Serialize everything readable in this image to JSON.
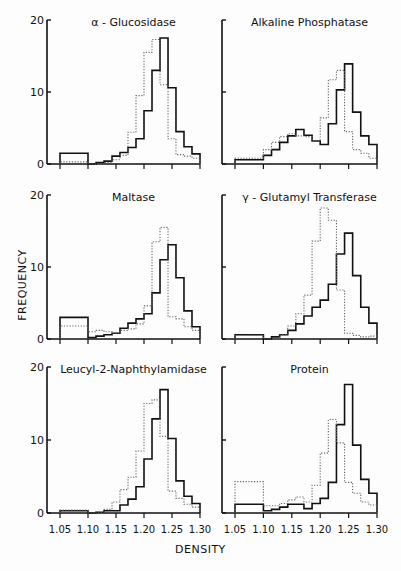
{
  "figure": {
    "ylabel": "FREQUENCY",
    "xlabel": "DENSITY",
    "x_ticks": [
      "1.05",
      "1.10",
      "1.15",
      "1.20",
      "1.25",
      "1.30"
    ],
    "y_ticks": [
      "0",
      "10",
      "20"
    ]
  },
  "chart_data": [
    {
      "type": "bar",
      "title": "α - Glucosidase",
      "xlabel": "DENSITY",
      "ylabel": "FREQUENCY",
      "xlim": [
        1.05,
        1.3
      ],
      "ylim": [
        0,
        20
      ],
      "bin_edges": [
        1.05,
        1.1,
        1.1143,
        1.1286,
        1.1429,
        1.1571,
        1.1714,
        1.1857,
        1.2,
        1.2143,
        1.2286,
        1.2429,
        1.2571,
        1.2714,
        1.2857,
        1.3
      ],
      "series": [
        {
          "name": "solid",
          "style": "solid",
          "values": [
            1.5,
            0,
            0.2,
            0.4,
            1.1,
            1.6,
            2.3,
            3.5,
            7.4,
            13,
            17.5,
            10.6,
            4.5,
            2.4,
            1.4
          ]
        },
        {
          "name": "dotted",
          "style": "dotted",
          "values": [
            0.3,
            0,
            0,
            0.2,
            0.6,
            1.2,
            4.4,
            9.5,
            15.5,
            17.3,
            11,
            3.5,
            1.3,
            1.1,
            0.8
          ]
        }
      ]
    },
    {
      "type": "bar",
      "title": "Alkaline Phosphatase",
      "xlabel": "DENSITY",
      "ylabel": "FREQUENCY",
      "xlim": [
        1.05,
        1.3
      ],
      "ylim": [
        0,
        20
      ],
      "bin_edges": [
        1.05,
        1.1,
        1.1143,
        1.1286,
        1.1429,
        1.1571,
        1.1714,
        1.1857,
        1.2,
        1.2143,
        1.2286,
        1.2429,
        1.2571,
        1.2714,
        1.2857,
        1.3
      ],
      "series": [
        {
          "name": "solid",
          "style": "solid",
          "values": [
            0.6,
            1.2,
            2.0,
            3.0,
            3.9,
            4.8,
            4.0,
            3.2,
            2.7,
            5.6,
            10.3,
            13.9,
            7.2,
            3.9,
            2.7
          ]
        },
        {
          "name": "dotted",
          "style": "dotted",
          "values": [
            0.8,
            2.0,
            3.0,
            3.8,
            4.2,
            3.9,
            3.8,
            3.2,
            6.4,
            11.7,
            13.0,
            4.5,
            2.0,
            1.5,
            0.8
          ]
        }
      ]
    },
    {
      "type": "bar",
      "title": "Maltase",
      "xlabel": "DENSITY",
      "ylabel": "FREQUENCY",
      "xlim": [
        1.05,
        1.3
      ],
      "ylim": [
        0,
        20
      ],
      "bin_edges": [
        1.05,
        1.1,
        1.1143,
        1.1286,
        1.1429,
        1.1571,
        1.1714,
        1.1857,
        1.2,
        1.2143,
        1.2286,
        1.2429,
        1.2571,
        1.2714,
        1.2857,
        1.3
      ],
      "series": [
        {
          "name": "solid",
          "style": "solid",
          "values": [
            3.0,
            0.2,
            0.4,
            0.6,
            0.8,
            1.5,
            2.2,
            2.8,
            3.5,
            6.4,
            11,
            13.1,
            8.5,
            3.9,
            1.7
          ]
        },
        {
          "name": "dotted",
          "style": "dotted",
          "values": [
            1.8,
            1.0,
            1.2,
            1.0,
            0.8,
            1.2,
            1.4,
            2.1,
            4.6,
            13.5,
            15.5,
            3.1,
            2.8,
            1.7,
            1.2
          ]
        }
      ]
    },
    {
      "type": "bar",
      "title": "γ - Glutamyl Transferase",
      "xlabel": "DENSITY",
      "ylabel": "FREQUENCY",
      "xlim": [
        1.05,
        1.3
      ],
      "ylim": [
        0,
        20
      ],
      "bin_edges": [
        1.05,
        1.1,
        1.1143,
        1.1286,
        1.1429,
        1.1571,
        1.1714,
        1.1857,
        1.2,
        1.2143,
        1.2286,
        1.2429,
        1.2571,
        1.2714,
        1.2857,
        1.3
      ],
      "series": [
        {
          "name": "solid",
          "style": "solid",
          "values": [
            0.6,
            0,
            0.3,
            0.6,
            1.2,
            2.1,
            3.2,
            4.4,
            5.4,
            7.6,
            11.8,
            14.7,
            8.8,
            4.4,
            2.2
          ]
        },
        {
          "name": "dotted",
          "style": "dotted",
          "values": [
            0.5,
            0,
            0,
            0.6,
            1.8,
            3.5,
            6.1,
            13.6,
            18.2,
            16.5,
            6.8,
            0.8,
            0.5,
            0.3,
            0.4
          ]
        }
      ]
    },
    {
      "type": "bar",
      "title": "Leucyl-2-Naphthylamidase",
      "xlabel": "DENSITY",
      "ylabel": "FREQUENCY",
      "xlim": [
        1.05,
        1.3
      ],
      "ylim": [
        0,
        20
      ],
      "bin_edges": [
        1.05,
        1.1,
        1.1143,
        1.1286,
        1.1429,
        1.1571,
        1.1714,
        1.1857,
        1.2,
        1.2143,
        1.2286,
        1.2429,
        1.2571,
        1.2714,
        1.2857,
        1.3
      ],
      "series": [
        {
          "name": "solid",
          "style": "solid",
          "values": [
            0.3,
            0,
            0.1,
            0.3,
            0.3,
            1.1,
            1.9,
            3.6,
            7.4,
            12.9,
            16.9,
            10.2,
            4.4,
            2.3,
            1.3
          ]
        },
        {
          "name": "dotted",
          "style": "dotted",
          "values": [
            0.4,
            0,
            0.1,
            0.5,
            1.5,
            3.2,
            4.9,
            8.5,
            15.0,
            15.5,
            10.5,
            3.0,
            2.0,
            1.2,
            0.8
          ]
        }
      ]
    },
    {
      "type": "bar",
      "title": "Protein",
      "xlabel": "DENSITY",
      "ylabel": "FREQUENCY",
      "xlim": [
        1.05,
        1.3
      ],
      "ylim": [
        0,
        20
      ],
      "bin_edges": [
        1.05,
        1.1,
        1.1143,
        1.1286,
        1.1429,
        1.1571,
        1.1714,
        1.1857,
        1.2,
        1.2143,
        1.2286,
        1.2429,
        1.2571,
        1.2714,
        1.2857,
        1.3
      ],
      "series": [
        {
          "name": "solid",
          "style": "solid",
          "values": [
            1.2,
            0.3,
            0.5,
            0.8,
            1.2,
            1.2,
            0.6,
            1.3,
            2.0,
            4.2,
            12.1,
            17.6,
            9.3,
            4.6,
            2.7
          ]
        },
        {
          "name": "dotted",
          "style": "dotted",
          "values": [
            4.3,
            1.0,
            1.0,
            1.3,
            1.8,
            2.2,
            1.5,
            3.8,
            8.2,
            12.8,
            9.6,
            4.2,
            2.7,
            1.5,
            1.1
          ]
        }
      ]
    }
  ]
}
